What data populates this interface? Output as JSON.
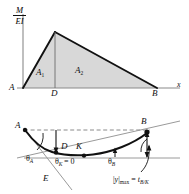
{
  "figure": {
    "colors": {
      "ink": "#111111",
      "area_fill": "#d8d8d8",
      "axis_gray": "#8a8a8a",
      "tangent_gray": "#9a9a9a",
      "dashed_gray": "#8a8a8a",
      "background": "#ffffff"
    }
  },
  "upper_diagram": {
    "name": "m-over-ei-diagram",
    "y_axis_label": {
      "numerator": "M",
      "denominator": "EI"
    },
    "x_axis_label": "x",
    "points": [
      {
        "id": "A",
        "label": "A"
      },
      {
        "id": "D",
        "label": "D"
      },
      {
        "id": "B",
        "label": "B"
      }
    ],
    "areas": [
      {
        "id": "A1",
        "base": "A",
        "sub": "1"
      },
      {
        "id": "A2",
        "base": "A",
        "sub": "2"
      }
    ]
  },
  "lower_diagram": {
    "name": "elastic-curve-diagram",
    "points": [
      {
        "id": "A",
        "label": "A"
      },
      {
        "id": "D",
        "label": "D"
      },
      {
        "id": "K",
        "label": "K"
      },
      {
        "id": "B",
        "label": "B"
      },
      {
        "id": "E",
        "label": "E"
      }
    ],
    "angles": [
      {
        "id": "theta_A",
        "base": "θ",
        "sub": "A"
      },
      {
        "id": "theta_B",
        "base": "θ",
        "sub": "B"
      },
      {
        "id": "theta_K",
        "base": "θ",
        "sub": "K",
        "equals": "= 0"
      }
    ],
    "max_deflection": {
      "lhs_abs_open": "|",
      "lhs_var": "y",
      "lhs_abs_close": "|",
      "lhs_sub": "max",
      "equals": "=",
      "rhs_var": "t",
      "rhs_sub": "B/K"
    }
  }
}
